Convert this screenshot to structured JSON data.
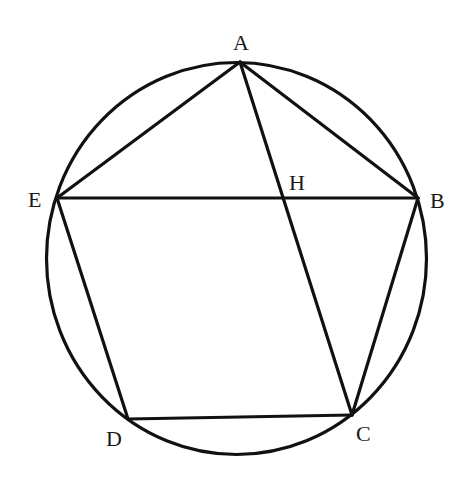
{
  "diagram": {
    "type": "geometry",
    "stroke_color": "#111111",
    "background": "#ffffff",
    "circle": {
      "cx": 236.5,
      "cy": 258.5,
      "rx": 190,
      "ry": 196
    },
    "points": {
      "A": {
        "x": 240,
        "y": 62,
        "label": "A",
        "label_x": 233,
        "label_y": 50
      },
      "B": {
        "x": 418,
        "y": 198,
        "label": "B",
        "label_x": 430,
        "label_y": 208
      },
      "C": {
        "x": 352,
        "y": 415,
        "label": "C",
        "label_x": 356,
        "label_y": 441
      },
      "D": {
        "x": 128,
        "y": 419,
        "label": "D",
        "label_x": 106,
        "label_y": 446
      },
      "E": {
        "x": 57,
        "y": 198,
        "label": "E",
        "label_x": 28,
        "label_y": 207
      },
      "H": {
        "x": 282,
        "y": 199,
        "label": "H",
        "label_x": 289,
        "label_y": 190
      }
    },
    "segments": [
      [
        "A",
        "B"
      ],
      [
        "B",
        "C"
      ],
      [
        "C",
        "D"
      ],
      [
        "D",
        "E"
      ],
      [
        "E",
        "A"
      ],
      [
        "A",
        "C"
      ],
      [
        "E",
        "B"
      ]
    ]
  }
}
